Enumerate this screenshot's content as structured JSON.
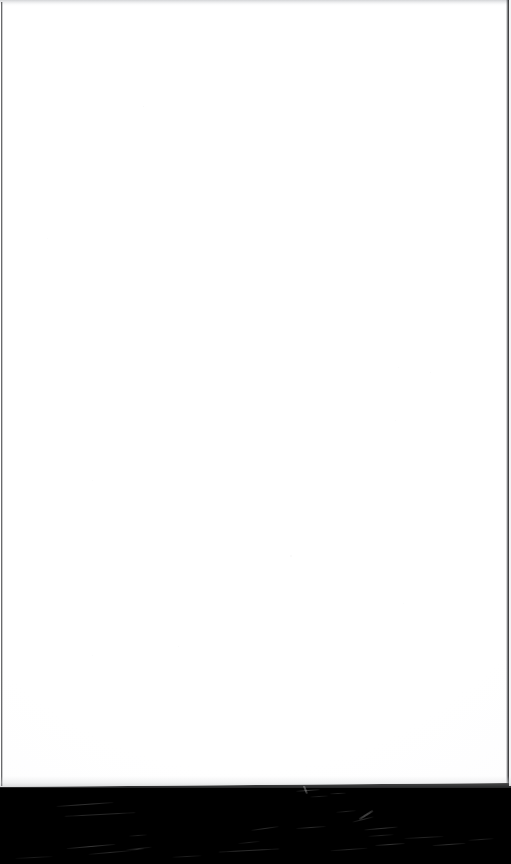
{
  "document": {
    "kind": "scanned-page",
    "page_content": "",
    "page_text": "",
    "is_blank": "true",
    "description": "Blank white scanned page with dark scanner-bed margin at the bottom"
  },
  "page": {
    "background_color": "#ffffff",
    "width_px": "511",
    "height_px": "787"
  },
  "margin": {
    "label": "",
    "background_color": "#000000",
    "top_px": "786",
    "height_px": "78"
  },
  "edges": {
    "left_border_color": "#141416",
    "right_border_color": "#0c0c0e",
    "top_band_color": "#b0b2b6"
  },
  "artifacts": {
    "scratches": [
      {
        "left": "56",
        "top": "18",
        "width": "58",
        "height": "1.4",
        "rotate": "-4",
        "opacity": "0.34"
      },
      {
        "left": "64",
        "top": "28",
        "width": "72",
        "height": "1.2",
        "rotate": "-3",
        "opacity": "0.28"
      },
      {
        "left": "66",
        "top": "60",
        "width": "50",
        "height": "1.1",
        "rotate": "-5",
        "opacity": "0.40"
      },
      {
        "left": "88",
        "top": "66",
        "width": "44",
        "height": "1.0",
        "rotate": "-5",
        "opacity": "0.30"
      },
      {
        "left": "126",
        "top": "62",
        "width": "26",
        "height": "1.0",
        "rotate": "-6",
        "opacity": "0.26"
      },
      {
        "left": "129",
        "top": "49",
        "width": "18",
        "height": "1.0",
        "rotate": "-4",
        "opacity": "0.22"
      },
      {
        "left": "130",
        "top": "63",
        "width": "14",
        "height": "0.9",
        "rotate": "-6",
        "opacity": "0.24"
      },
      {
        "left": "218",
        "top": "64",
        "width": "62",
        "height": "1.1",
        "rotate": "-3",
        "opacity": "0.30"
      },
      {
        "left": "220",
        "top": "92",
        "width": "40",
        "height": "1.0",
        "rotate": "-3",
        "opacity": "0.22"
      },
      {
        "left": "251",
        "top": "42",
        "width": "28",
        "height": "1.2",
        "rotate": "-8",
        "opacity": "0.30"
      },
      {
        "left": "238",
        "top": "56",
        "width": "22",
        "height": "1.0",
        "rotate": "-6",
        "opacity": "0.22"
      },
      {
        "left": "296",
        "top": "4",
        "width": "24",
        "height": "1.0",
        "rotate": "-4",
        "opacity": "0.40"
      },
      {
        "left": "296",
        "top": "41",
        "width": "30",
        "height": "1.1",
        "rotate": "-4",
        "opacity": "0.30"
      },
      {
        "left": "310",
        "top": "10",
        "width": "18",
        "height": "0.9",
        "rotate": "-3",
        "opacity": "0.22"
      },
      {
        "left": "330",
        "top": "7",
        "width": "16",
        "height": "0.9",
        "rotate": "-2",
        "opacity": "0.26"
      },
      {
        "left": "330",
        "top": "63",
        "width": "38",
        "height": "1.1",
        "rotate": "-4",
        "opacity": "0.26"
      },
      {
        "left": "336",
        "top": "25",
        "width": "20",
        "height": "1.0",
        "rotate": "-5",
        "opacity": "0.24"
      },
      {
        "left": "358",
        "top": "28",
        "width": "16",
        "height": "1.6",
        "rotate": "-32",
        "opacity": "0.46"
      },
      {
        "left": "352",
        "top": "33",
        "width": "22",
        "height": "1.2",
        "rotate": "-14",
        "opacity": "0.30"
      },
      {
        "left": "364",
        "top": "42",
        "width": "34",
        "height": "1.3",
        "rotate": "-5",
        "opacity": "0.34"
      },
      {
        "left": "368",
        "top": "49",
        "width": "26",
        "height": "1.0",
        "rotate": "-4",
        "opacity": "0.24"
      },
      {
        "left": "375",
        "top": "58",
        "width": "30",
        "height": "1.2",
        "rotate": "-4",
        "opacity": "0.36"
      },
      {
        "left": "404",
        "top": "51",
        "width": "40",
        "height": "1.1",
        "rotate": "-3",
        "opacity": "0.26"
      },
      {
        "left": "432",
        "top": "58",
        "width": "34",
        "height": "1.2",
        "rotate": "-4",
        "opacity": "0.32"
      },
      {
        "left": "468",
        "top": "53",
        "width": "26",
        "height": "1.0",
        "rotate": "-4",
        "opacity": "0.24"
      },
      {
        "left": "300",
        "top": "2",
        "width": "10",
        "height": "2.4",
        "rotate": "68",
        "opacity": "0.50"
      },
      {
        "left": "15",
        "top": "71",
        "width": "38",
        "height": "1.0",
        "rotate": "-3",
        "opacity": "0.20"
      },
      {
        "left": "172",
        "top": "70",
        "width": "30",
        "height": "1.0",
        "rotate": "-3",
        "opacity": "0.22"
      }
    ],
    "specks": [
      {
        "left": "143",
        "top": "106",
        "size": "1.4",
        "opacity": "0.30"
      },
      {
        "left": "290",
        "top": "555",
        "size": "1.6",
        "opacity": "0.26"
      },
      {
        "left": "403",
        "top": "603",
        "size": "1.3",
        "opacity": "0.22"
      },
      {
        "left": "178",
        "top": "646",
        "size": "1.2",
        "opacity": "0.20"
      },
      {
        "left": "92",
        "top": "655",
        "size": "1.3",
        "opacity": "0.22"
      },
      {
        "left": "398",
        "top": "367",
        "size": "1.2",
        "opacity": "0.18"
      },
      {
        "left": "430",
        "top": "372",
        "size": "1.4",
        "opacity": "0.20"
      },
      {
        "left": "395",
        "top": "420",
        "size": "1.1",
        "opacity": "0.18"
      },
      {
        "left": "92",
        "top": "480",
        "size": "1.2",
        "opacity": "0.18"
      },
      {
        "left": "47",
        "top": "238",
        "size": "1.1",
        "opacity": "0.16"
      }
    ]
  }
}
